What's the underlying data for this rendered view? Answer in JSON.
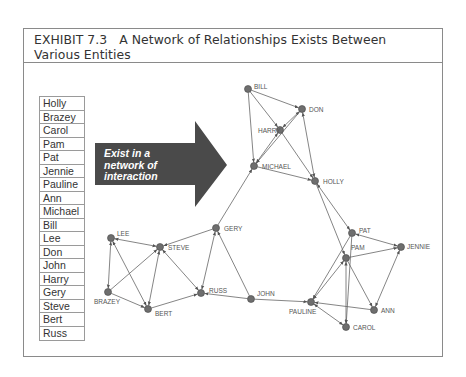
{
  "exhibit": {
    "number": "EXHIBIT 7.3",
    "title": "A Network of Relationships Exists Between Various Entities"
  },
  "name_list": [
    "Holly",
    "Brazey",
    "Carol",
    "Pam",
    "Pat",
    "Jennie",
    "Pauline",
    "Ann",
    "Michael",
    "Bill",
    "Lee",
    "Don",
    "John",
    "Harry",
    "Gery",
    "Steve",
    "Bert",
    "Russ"
  ],
  "arrow": {
    "line1": "Exist in a",
    "line2": "network of",
    "line3": "interaction",
    "color": "#4a4a4a"
  },
  "network": {
    "node_color": "#6e6e6e",
    "edge_color": "#666666",
    "nodes": {
      "bill": {
        "label": "BILL",
        "x": 248,
        "y": 89
      },
      "don": {
        "label": "DON",
        "x": 302,
        "y": 109
      },
      "harry": {
        "label": "HARRY",
        "x": 280,
        "y": 130
      },
      "michael": {
        "label": "MICHAEL",
        "x": 254,
        "y": 166
      },
      "holly": {
        "label": "HOLLY",
        "x": 315,
        "y": 181
      },
      "pat": {
        "label": "PAT",
        "x": 352,
        "y": 233
      },
      "pam": {
        "label": "PAM",
        "x": 346,
        "y": 258
      },
      "jennie": {
        "label": "JENNIE",
        "x": 401,
        "y": 247
      },
      "ann": {
        "label": "ANN",
        "x": 374,
        "y": 310
      },
      "pauline": {
        "label": "PAULINE",
        "x": 311,
        "y": 302
      },
      "carol": {
        "label": "CAROL",
        "x": 346,
        "y": 327
      },
      "gery": {
        "label": "GERY",
        "x": 216,
        "y": 228
      },
      "russ": {
        "label": "RUSS",
        "x": 201,
        "y": 293
      },
      "john": {
        "label": "JOHN",
        "x": 251,
        "y": 299
      },
      "lee": {
        "label": "LEE",
        "x": 111,
        "y": 238
      },
      "steve": {
        "label": "STEVE",
        "x": 160,
        "y": 247
      },
      "brazey": {
        "label": "BRAZEY",
        "x": 108,
        "y": 292
      },
      "bert": {
        "label": "BERT",
        "x": 148,
        "y": 309
      }
    }
  }
}
